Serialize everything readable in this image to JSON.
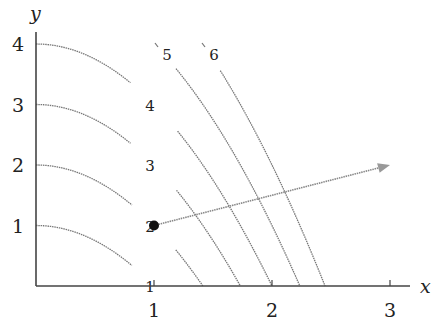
{
  "chart_data": {
    "type": "line",
    "title": "",
    "xlabel": "x",
    "ylabel": "y",
    "xlim": [
      0,
      3.2
    ],
    "ylim": [
      0,
      4.3
    ],
    "xticks": [
      1,
      2,
      3
    ],
    "yticks": [
      1,
      2,
      3,
      4
    ],
    "grid": false,
    "level_curves": [
      {
        "label": "1",
        "level": 1
      },
      {
        "label": "2",
        "level": 2
      },
      {
        "label": "3",
        "level": 3
      },
      {
        "label": "4",
        "level": 4
      },
      {
        "label": "5",
        "level": 5
      },
      {
        "label": "6",
        "level": 6
      }
    ],
    "point": {
      "x": 1,
      "y": 1
    },
    "vector": {
      "from": [
        1,
        1
      ],
      "to": [
        3,
        2
      ]
    }
  }
}
